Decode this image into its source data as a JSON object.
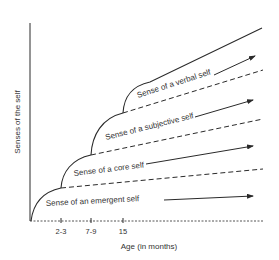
{
  "diagram": {
    "y_axis_label": "Senses of the self",
    "x_axis_label": "Age (in months)",
    "x_ticks": [
      "2-3",
      "7-9",
      "15"
    ],
    "domains": [
      {
        "label": "Sense of an emergent self",
        "onset": "birth"
      },
      {
        "label": "Sense of a core self",
        "onset": "2-3"
      },
      {
        "label": "Sense of a subjective self",
        "onset": "7-9"
      },
      {
        "label": "Sense of a verbal self",
        "onset": "15"
      }
    ],
    "line_color": "#2a2a2a",
    "background": "#ffffff"
  }
}
